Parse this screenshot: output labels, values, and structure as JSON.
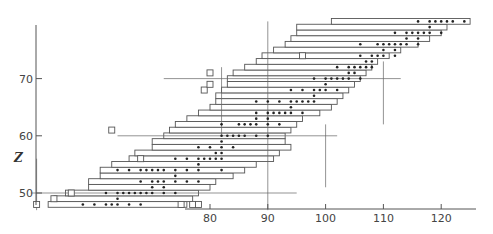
{
  "chart_data": {
    "type": "bar",
    "title": "",
    "xlabel": "",
    "ylabel": "Z",
    "xlim": [
      57,
      127
    ],
    "ylim": [
      47,
      81
    ],
    "x_ticks": [
      80,
      90,
      100,
      110,
      120
    ],
    "y_ticks": [
      50,
      60,
      70
    ],
    "grid": false,
    "rows": [
      {
        "z": 48,
        "n_min": 52,
        "n_max": 76,
        "stable": [
          58,
          60,
          62,
          63,
          64,
          66,
          68
        ]
      },
      {
        "z": 49,
        "n_min": 53,
        "n_max": 77,
        "stable": [
          64
        ]
      },
      {
        "z": 50,
        "n_min": 55,
        "n_max": 78,
        "stable": [
          62,
          64,
          65,
          66,
          67,
          68,
          69,
          70,
          72,
          74
        ]
      },
      {
        "z": 51,
        "n_min": 59,
        "n_max": 80,
        "stable": [
          70,
          72
        ]
      },
      {
        "z": 52,
        "n_min": 59,
        "n_max": 81,
        "stable": [
          68,
          70,
          71,
          72,
          74,
          76,
          78
        ]
      },
      {
        "z": 53,
        "n_min": 61,
        "n_max": 84,
        "stable": [
          74
        ]
      },
      {
        "z": 54,
        "n_min": 61,
        "n_max": 86,
        "stable": [
          64,
          66,
          68,
          69,
          70,
          71,
          72,
          74,
          76,
          78,
          82
        ]
      },
      {
        "z": 55,
        "n_min": 63,
        "n_max": 88,
        "stable": [
          78
        ]
      },
      {
        "z": 56,
        "n_min": 66,
        "n_max": 91,
        "stable": [
          74,
          76,
          78,
          79,
          80,
          81,
          82
        ]
      },
      {
        "z": 57,
        "n_min": 67,
        "n_max": 92,
        "stable": [
          81,
          82
        ]
      },
      {
        "z": 58,
        "n_min": 70,
        "n_max": 94,
        "stable": [
          78,
          80,
          82,
          84
        ]
      },
      {
        "z": 59,
        "n_min": 70,
        "n_max": 93,
        "stable": [
          82
        ]
      },
      {
        "z": 60,
        "n_min": 72,
        "n_max": 93,
        "stable": [
          82,
          83,
          84,
          85,
          86,
          88,
          90
        ]
      },
      {
        "z": 61,
        "n_min": 73,
        "n_max": 94,
        "stable": []
      },
      {
        "z": 62,
        "n_min": 74,
        "n_max": 95,
        "stable": [
          82,
          85,
          86,
          87,
          88,
          90,
          92
        ]
      },
      {
        "z": 63,
        "n_min": 76,
        "n_max": 96,
        "stable": [
          88,
          90
        ]
      },
      {
        "z": 64,
        "n_min": 78,
        "n_max": 99,
        "stable": [
          88,
          90,
          91,
          92,
          93,
          94,
          96
        ]
      },
      {
        "z": 65,
        "n_min": 80,
        "n_max": 101,
        "stable": [
          94
        ]
      },
      {
        "z": 66,
        "n_min": 81,
        "n_max": 102,
        "stable": [
          88,
          90,
          92,
          94,
          95,
          96,
          97,
          98
        ]
      },
      {
        "z": 67,
        "n_min": 81,
        "n_max": 103,
        "stable": [
          98
        ]
      },
      {
        "z": 68,
        "n_min": 82,
        "n_max": 104,
        "stable": [
          94,
          96,
          98,
          99,
          100,
          102
        ]
      },
      {
        "z": 69,
        "n_min": 83,
        "n_max": 105,
        "stable": [
          100
        ]
      },
      {
        "z": 70,
        "n_min": 83,
        "n_max": 106,
        "stable": [
          98,
          100,
          101,
          102,
          103,
          104,
          106
        ]
      },
      {
        "z": 71,
        "n_min": 84,
        "n_max": 107,
        "stable": [
          104,
          105
        ]
      },
      {
        "z": 72,
        "n_min": 86,
        "n_max": 108,
        "stable": [
          102,
          104,
          105,
          106,
          107,
          108
        ]
      },
      {
        "z": 73,
        "n_min": 88,
        "n_max": 109,
        "stable": [
          107,
          108
        ]
      },
      {
        "z": 74,
        "n_min": 89,
        "n_max": 111,
        "stable": [
          106,
          108,
          109,
          110,
          112
        ]
      },
      {
        "z": 75,
        "n_min": 91,
        "n_max": 113,
        "stable": [
          110,
          112
        ]
      },
      {
        "z": 76,
        "n_min": 93,
        "n_max": 116,
        "stable": [
          106,
          109,
          110,
          111,
          112,
          113,
          114,
          116
        ]
      },
      {
        "z": 77,
        "n_min": 94,
        "n_max": 118,
        "stable": [
          114,
          116
        ]
      },
      {
        "z": 78,
        "n_min": 95,
        "n_max": 120,
        "stable": [
          112,
          114,
          115,
          116,
          117,
          118,
          120
        ]
      },
      {
        "z": 79,
        "n_min": 95,
        "n_max": 121,
        "stable": [
          118
        ]
      },
      {
        "z": 80,
        "n_min": 101,
        "n_max": 125,
        "stable": [
          116,
          118,
          119,
          120,
          121,
          122,
          124
        ]
      }
    ],
    "isomer_boxes": [
      {
        "n": 50,
        "z": 48
      },
      {
        "n": 53,
        "z": 49
      },
      {
        "n": 56,
        "z": 50
      },
      {
        "n": 75,
        "z": 48
      },
      {
        "n": 77,
        "z": 48
      },
      {
        "n": 78,
        "z": 48
      },
      {
        "n": 63,
        "z": 61
      },
      {
        "n": 68,
        "z": 56
      },
      {
        "n": 79,
        "z": 68
      },
      {
        "n": 80,
        "z": 69
      },
      {
        "n": 80,
        "z": 71
      },
      {
        "n": 96,
        "z": 74
      }
    ],
    "magic_lines": [
      {
        "orientation": "vertical",
        "n": 50,
        "z_range": [
          47,
          56
        ]
      },
      {
        "orientation": "vertical",
        "n": 82,
        "z_range": [
          60,
          72
        ]
      },
      {
        "orientation": "vertical",
        "n": 90,
        "z_range": [
          47,
          80
        ]
      },
      {
        "orientation": "vertical",
        "n": 100,
        "z_range": [
          51,
          62
        ]
      },
      {
        "orientation": "vertical",
        "n": 110,
        "z_range": [
          62,
          73
        ]
      },
      {
        "orientation": "horizontal",
        "z": 50,
        "n_range": [
          49,
          95
        ]
      },
      {
        "orientation": "horizontal",
        "z": 60,
        "n_range": [
          64,
          102
        ]
      },
      {
        "orientation": "horizontal",
        "z": 70,
        "n_range": [
          72,
          113
        ]
      }
    ]
  }
}
